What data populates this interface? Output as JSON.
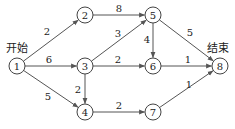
{
  "diagram": {
    "type": "network-graph",
    "start_label": "开始",
    "end_label": "结束",
    "nodes": [
      {
        "id": "1",
        "x": 17,
        "y": 66
      },
      {
        "id": "2",
        "x": 85,
        "y": 15
      },
      {
        "id": "3",
        "x": 85,
        "y": 66
      },
      {
        "id": "4",
        "x": 85,
        "y": 112
      },
      {
        "id": "5",
        "x": 153,
        "y": 15
      },
      {
        "id": "6",
        "x": 153,
        "y": 66
      },
      {
        "id": "7",
        "x": 153,
        "y": 112
      },
      {
        "id": "8",
        "x": 220,
        "y": 66
      }
    ],
    "edges": [
      {
        "from": "1",
        "to": "2",
        "weight": "2",
        "lx": 47,
        "ly": 31
      },
      {
        "from": "1",
        "to": "3",
        "weight": "6",
        "lx": 49,
        "ly": 59
      },
      {
        "from": "1",
        "to": "4",
        "weight": "5",
        "lx": 48,
        "ly": 96
      },
      {
        "from": "2",
        "to": "5",
        "weight": "8",
        "lx": 119,
        "ly": 8
      },
      {
        "from": "3",
        "to": "5",
        "weight": "3",
        "lx": 118,
        "ly": 33
      },
      {
        "from": "3",
        "to": "6",
        "weight": "2",
        "lx": 118,
        "ly": 59
      },
      {
        "from": "3",
        "to": "4",
        "weight": "2",
        "lx": 78,
        "ly": 89
      },
      {
        "from": "5",
        "to": "6",
        "weight": "4",
        "lx": 147,
        "ly": 39
      },
      {
        "from": "5",
        "to": "8",
        "weight": "5",
        "lx": 190,
        "ly": 32
      },
      {
        "from": "6",
        "to": "8",
        "weight": "1",
        "lx": 188,
        "ly": 59
      },
      {
        "from": "4",
        "to": "7",
        "weight": "2",
        "lx": 119,
        "ly": 105
      },
      {
        "from": "7",
        "to": "8",
        "weight": "1",
        "lx": 189,
        "ly": 84
      }
    ]
  }
}
